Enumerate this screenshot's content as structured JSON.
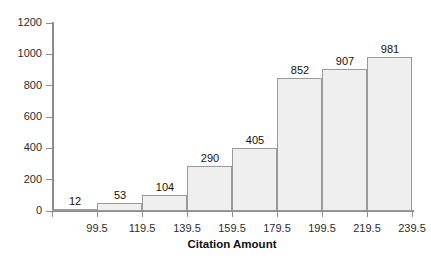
{
  "chart_data": {
    "type": "bar",
    "title": "",
    "xlabel": "Citation Amount",
    "ylabel": "",
    "categories": [
      "99.5",
      "119.5",
      "139.5",
      "159.5",
      "179.5",
      "199.5",
      "219.5",
      "239.5"
    ],
    "values": [
      12,
      53,
      104,
      290,
      405,
      852,
      907,
      981
    ],
    "data_labels": [
      "12",
      "53",
      "104",
      "290",
      "405",
      "852",
      "907",
      "981"
    ],
    "ylim": [
      0,
      1200
    ],
    "y_ticks": [
      0,
      200,
      400,
      600,
      800,
      1000,
      1200
    ],
    "y_tick_labels": [
      "0",
      "200",
      "400",
      "600",
      "800",
      "1000",
      "1200"
    ],
    "x_tick_labels": [
      "99.5",
      "119.5",
      "139.5",
      "159.5",
      "179.5",
      "199.5",
      "219.5",
      "239.5"
    ],
    "grid": false,
    "legend": null,
    "colors": {
      "bar_fill": "#efefef",
      "bar_border": "#9a9a9a",
      "axis": "#8c8c8c",
      "text": "#111111",
      "background": "#ffffff"
    }
  }
}
